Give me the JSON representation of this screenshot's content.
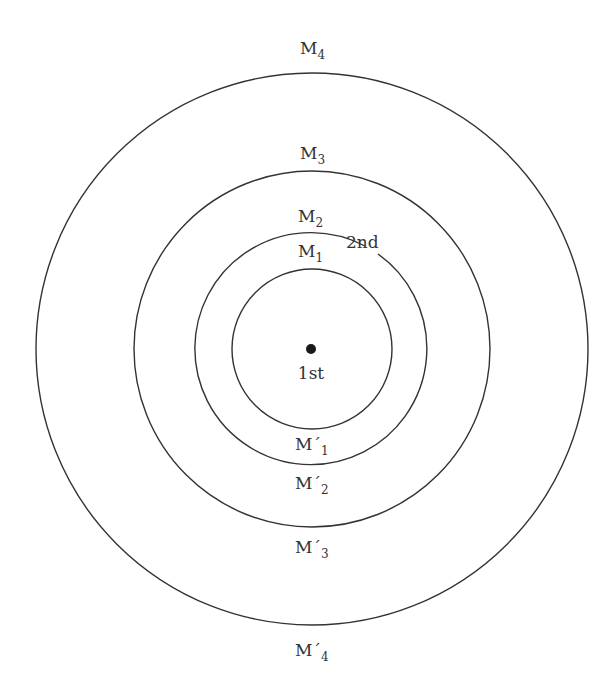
{
  "diagram": {
    "center": {
      "x": 312,
      "y": 349,
      "label": "1st"
    },
    "rings": [
      {
        "name": "M1",
        "top_label": "M",
        "top_sub": "1",
        "bottom_label": "M´",
        "bottom_sub": "1",
        "r": 80
      },
      {
        "name": "M2",
        "top_label": "M",
        "top_sub": "2",
        "bottom_label": "M´",
        "bottom_sub": "2",
        "r": 116,
        "break_label": "2nd"
      },
      {
        "name": "M3",
        "top_label": "M",
        "top_sub": "3",
        "bottom_label": "M´",
        "bottom_sub": "3",
        "r": 178
      },
      {
        "name": "M4",
        "top_label": "M",
        "top_sub": "4",
        "bottom_label": "M´",
        "bottom_sub": "4",
        "r": 276
      }
    ],
    "stroke_color": "#333333",
    "background": "#ffffff"
  }
}
